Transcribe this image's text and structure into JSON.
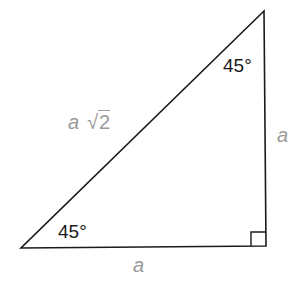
{
  "diagram": {
    "type": "right-triangle",
    "vertices": {
      "top": [
        264,
        11
      ],
      "bottom_left": [
        21,
        248
      ],
      "bottom_right": [
        266,
        246
      ]
    },
    "line_color": "#1a1a1a",
    "label_color": "#9a9a9a",
    "labels": {
      "top_angle": "45°",
      "bottom_angle": "45°",
      "hypotenuse_var": "a",
      "hypotenuse_radical": "√",
      "hypotenuse_radicand": "2",
      "right_side": "a",
      "bottom_side": "a"
    },
    "right_angle_marker": true
  }
}
